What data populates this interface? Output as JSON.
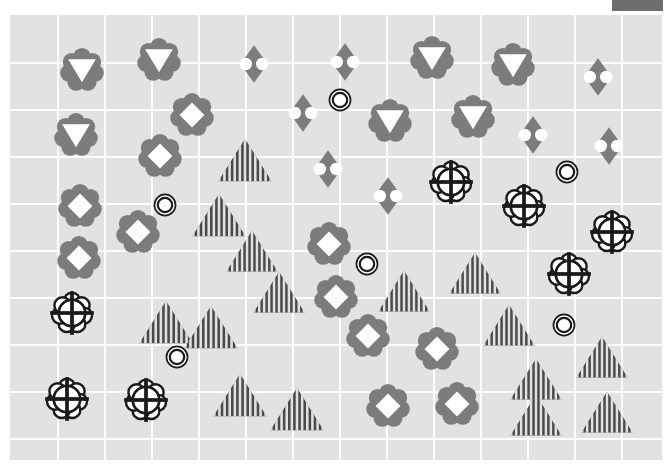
{
  "canvas": {
    "width": 672,
    "height": 474
  },
  "legend_bar": {
    "name": "legend-swatch",
    "x": 612,
    "y": 0,
    "width": 51,
    "height": 11,
    "color": "#6e6e6e"
  },
  "plot": {
    "x": 10,
    "y": 15,
    "width": 652,
    "height": 445,
    "background_color": "#e2e2e2",
    "gridline_color": "#fdfdfd",
    "grid": {
      "show": true,
      "v_step": 47,
      "h_step": 47,
      "v_count": 14,
      "h_count": 10
    }
  },
  "palette": {
    "flower_gray": "#7c7c7c",
    "flower_white": "#ffffff",
    "diamond_gray": "#7c7c7c",
    "triangle_dark": "#4a4a4a",
    "triangle_stripe": "#e2e2e2",
    "outline_black": "#1a1a1a",
    "fill_white": "#ffffff"
  },
  "glyph_types": {
    "flower-triangle": "gray-flower-with-white-down-triangle",
    "flower-diamond": "gray-flower-with-white-diamond",
    "diamond-circles": "gray-diamond-with-two-white-circles",
    "flower-crosshair": "white-flower-with-black-crosshair",
    "double-circle": "black-concentric-double-circle",
    "striped-triangle": "dark-triangle-with-vertical-stripes"
  },
  "chart_data": {
    "type": "scatter",
    "title": "",
    "xlabel": "",
    "ylabel": "",
    "xlim": [
      0,
      672
    ],
    "ylim": [
      0,
      474
    ],
    "grid": true,
    "legend": "none",
    "series": [
      {
        "name": "flower-triangle",
        "count": 7,
        "points": [
          {
            "x": 82,
            "y": 70,
            "s": 46
          },
          {
            "x": 159,
            "y": 60,
            "s": 46
          },
          {
            "x": 76,
            "y": 135,
            "s": 46
          },
          {
            "x": 390,
            "y": 121,
            "s": 46
          },
          {
            "x": 432,
            "y": 58,
            "s": 46
          },
          {
            "x": 513,
            "y": 65,
            "s": 46
          },
          {
            "x": 473,
            "y": 117,
            "s": 46
          }
        ]
      },
      {
        "name": "flower-diamond",
        "count": 11,
        "points": [
          {
            "x": 192,
            "y": 115,
            "s": 46
          },
          {
            "x": 160,
            "y": 156,
            "s": 46
          },
          {
            "x": 80,
            "y": 206,
            "s": 46
          },
          {
            "x": 138,
            "y": 232,
            "s": 46
          },
          {
            "x": 79,
            "y": 258,
            "s": 46
          },
          {
            "x": 329,
            "y": 244,
            "s": 46
          },
          {
            "x": 336,
            "y": 297,
            "s": 46
          },
          {
            "x": 368,
            "y": 336,
            "s": 46
          },
          {
            "x": 437,
            "y": 349,
            "s": 46
          },
          {
            "x": 388,
            "y": 406,
            "s": 46
          },
          {
            "x": 457,
            "y": 404,
            "s": 46
          }
        ]
      },
      {
        "name": "diamond-circles",
        "count": 10,
        "points": [
          {
            "x": 254,
            "y": 64,
            "s": 40
          },
          {
            "x": 345,
            "y": 62,
            "s": 40
          },
          {
            "x": 598,
            "y": 77,
            "s": 40
          },
          {
            "x": 303,
            "y": 113,
            "s": 40
          },
          {
            "x": 533,
            "y": 135,
            "s": 40
          },
          {
            "x": 609,
            "y": 146,
            "s": 40
          },
          {
            "x": 328,
            "y": 169,
            "s": 40
          },
          {
            "x": 388,
            "y": 196,
            "s": 40
          },
          {
            "x": 0,
            "y": 0,
            "s": 0
          },
          {
            "x": 0,
            "y": 0,
            "s": 0
          }
        ]
      },
      {
        "name": "flower-crosshair",
        "count": 7,
        "points": [
          {
            "x": 451,
            "y": 182,
            "s": 44
          },
          {
            "x": 524,
            "y": 206,
            "s": 44
          },
          {
            "x": 612,
            "y": 232,
            "s": 44
          },
          {
            "x": 569,
            "y": 274,
            "s": 44
          },
          {
            "x": 72,
            "y": 313,
            "s": 44
          },
          {
            "x": 67,
            "y": 399,
            "s": 44
          },
          {
            "x": 146,
            "y": 400,
            "s": 44
          }
        ]
      },
      {
        "name": "double-circle",
        "count": 6,
        "points": [
          {
            "x": 340,
            "y": 100,
            "s": 24
          },
          {
            "x": 567,
            "y": 172,
            "s": 24
          },
          {
            "x": 165,
            "y": 205,
            "s": 24
          },
          {
            "x": 367,
            "y": 264,
            "s": 24
          },
          {
            "x": 564,
            "y": 325,
            "s": 24
          },
          {
            "x": 177,
            "y": 357,
            "s": 24
          }
        ]
      },
      {
        "name": "striped-triangle",
        "count": 16,
        "points": [
          {
            "x": 245,
            "y": 160,
            "s": 54
          },
          {
            "x": 219,
            "y": 215,
            "s": 54
          },
          {
            "x": 252,
            "y": 251,
            "s": 52
          },
          {
            "x": 475,
            "y": 273,
            "s": 52
          },
          {
            "x": 279,
            "y": 292,
            "s": 52
          },
          {
            "x": 404,
            "y": 291,
            "s": 52
          },
          {
            "x": 166,
            "y": 322,
            "s": 54
          },
          {
            "x": 211,
            "y": 327,
            "s": 54
          },
          {
            "x": 509,
            "y": 325,
            "s": 52
          },
          {
            "x": 602,
            "y": 357,
            "s": 52
          },
          {
            "x": 536,
            "y": 379,
            "s": 52
          },
          {
            "x": 240,
            "y": 395,
            "s": 54
          },
          {
            "x": 297,
            "y": 409,
            "s": 54
          },
          {
            "x": 536,
            "y": 415,
            "s": 52
          },
          {
            "x": 607,
            "y": 412,
            "s": 52
          },
          {
            "x": 0,
            "y": 0,
            "s": 0
          }
        ]
      }
    ]
  }
}
